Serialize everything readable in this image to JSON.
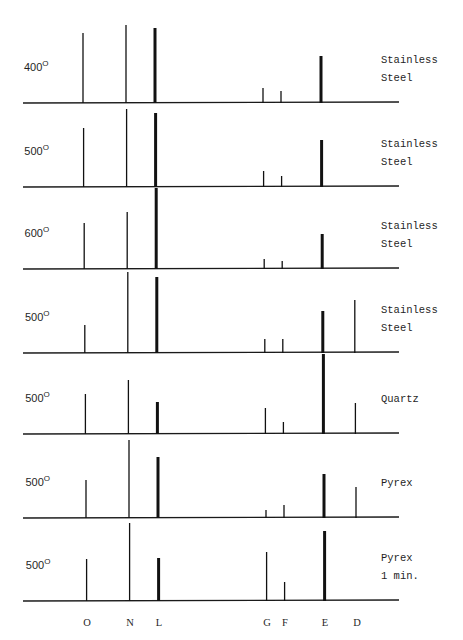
{
  "chart_data": {
    "type": "bar",
    "title": "",
    "xlabel": "",
    "ylabel": "",
    "categories": [
      "O",
      "N",
      "L",
      "G",
      "F",
      "E",
      "D"
    ],
    "category_x": [
      83,
      126,
      155,
      263,
      281,
      321,
      353
    ],
    "thick_lines": [
      "L",
      "E"
    ],
    "grid": false,
    "legend": null,
    "panels": [
      {
        "temperature": "400",
        "unit": "o",
        "material": [
          "Stainless",
          "Steel"
        ],
        "baseline_y": 103,
        "values": {
          "O": 70,
          "N": 78,
          "L": 75,
          "G": 15,
          "F": 12,
          "E": 47,
          "D": 0
        }
      },
      {
        "temperature": "500",
        "unit": "o",
        "material": [
          "Stainless",
          "Steel"
        ],
        "baseline_y": 187,
        "values": {
          "O": 59,
          "N": 78,
          "L": 74,
          "G": 16,
          "F": 11,
          "E": 47,
          "D": 0
        }
      },
      {
        "temperature": "600",
        "unit": "o",
        "material": [
          "Stainless",
          "Steel"
        ],
        "baseline_y": 269,
        "values": {
          "O": 46,
          "N": 57,
          "L": 81,
          "G": 10,
          "F": 8,
          "E": 35,
          "D": 0
        }
      },
      {
        "temperature": "500",
        "unit": "o",
        "material": [
          "Stainless",
          "Steel"
        ],
        "baseline_y": 353,
        "values": {
          "O": 28,
          "N": 81,
          "L": 76,
          "G": 14,
          "F": 14,
          "E": 42,
          "D": 53
        }
      },
      {
        "temperature": "500",
        "unit": "o",
        "material": [
          "Quartz"
        ],
        "baseline_y": 434,
        "values": {
          "O": 40,
          "N": 54,
          "L": 32,
          "G": 26,
          "F": 12,
          "E": 80,
          "D": 31
        }
      },
      {
        "temperature": "500",
        "unit": "o",
        "material": [
          "Pyrex"
        ],
        "baseline_y": 518,
        "values": {
          "O": 38,
          "N": 78,
          "L": 61,
          "G": 8,
          "F": 13,
          "E": 44,
          "D": 31
        }
      },
      {
        "temperature": "500",
        "unit": "o",
        "material": [
          "Pyrex",
          "1 min."
        ],
        "baseline_y": 601,
        "values": {
          "O": 42,
          "N": 78,
          "L": 43,
          "G": 49,
          "F": 19,
          "E": 70,
          "D": 0
        }
      }
    ]
  }
}
